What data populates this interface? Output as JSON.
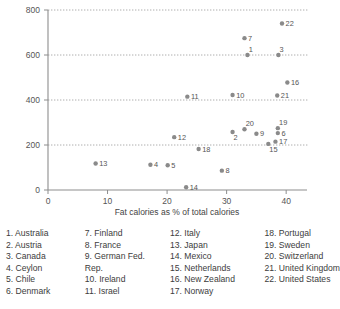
{
  "chart_data": {
    "type": "scatter",
    "title": "",
    "xlabel": "Fat calories as % of total calories",
    "ylabel": "",
    "xlim": [
      0,
      43.5
    ],
    "ylim": [
      0,
      800
    ],
    "xticks": [
      0,
      10,
      20,
      30,
      40
    ],
    "yticks": [
      0,
      200,
      400,
      600,
      800
    ],
    "xtick_labels": [
      "0",
      "10",
      "20",
      "30",
      "40"
    ],
    "ytick_labels": [
      "0",
      "200",
      "400",
      "600",
      "800"
    ],
    "grid": "horizontal-dotted",
    "legend_position": "below-plot",
    "marker_color": "#8a8a8a",
    "points": [
      {
        "id": "1",
        "name": "Australia",
        "x": 33.5,
        "y": 600,
        "label_pos": "above-right"
      },
      {
        "id": "2",
        "name": "Austria",
        "x": 31.0,
        "y": 258,
        "label_pos": "below-right"
      },
      {
        "id": "3",
        "name": "Canada",
        "x": 38.7,
        "y": 600,
        "label_pos": "above-right"
      },
      {
        "id": "4",
        "name": "Ceylon",
        "x": 17.2,
        "y": 112,
        "label_pos": "right"
      },
      {
        "id": "5",
        "name": "Chile",
        "x": 20.1,
        "y": 110,
        "label_pos": "right"
      },
      {
        "id": "6",
        "name": "Denmark",
        "x": 38.6,
        "y": 253,
        "label_pos": "right"
      },
      {
        "id": "7",
        "name": "Finland",
        "x": 33.0,
        "y": 675,
        "label_pos": "right"
      },
      {
        "id": "8",
        "name": "France",
        "x": 29.2,
        "y": 86,
        "label_pos": "right"
      },
      {
        "id": "9",
        "name": "German Fed. Rep.",
        "x": 35.0,
        "y": 250,
        "label_pos": "right"
      },
      {
        "id": "10",
        "name": "Ireland",
        "x": 31.0,
        "y": 422,
        "label_pos": "right"
      },
      {
        "id": "11",
        "name": "Israel",
        "x": 23.4,
        "y": 415,
        "label_pos": "right"
      },
      {
        "id": "12",
        "name": "Italy",
        "x": 21.2,
        "y": 235,
        "label_pos": "right"
      },
      {
        "id": "13",
        "name": "Japan",
        "x": 8.0,
        "y": 118,
        "label_pos": "right"
      },
      {
        "id": "14",
        "name": "Mexico",
        "x": 23.2,
        "y": 12,
        "label_pos": "right"
      },
      {
        "id": "15",
        "name": "Netherlands",
        "x": 37.0,
        "y": 205,
        "label_pos": "below-right"
      },
      {
        "id": "16",
        "name": "New Zealand",
        "x": 40.2,
        "y": 478,
        "label_pos": "right"
      },
      {
        "id": "17",
        "name": "Norway",
        "x": 38.2,
        "y": 215,
        "label_pos": "right"
      },
      {
        "id": "18",
        "name": "Portugal",
        "x": 25.3,
        "y": 182,
        "label_pos": "right"
      },
      {
        "id": "19",
        "name": "Sweden",
        "x": 38.6,
        "y": 275,
        "label_pos": "above-right"
      },
      {
        "id": "20",
        "name": "Switzerland",
        "x": 33.0,
        "y": 270,
        "label_pos": "above-right"
      },
      {
        "id": "21",
        "name": "United Kingdom",
        "x": 38.5,
        "y": 420,
        "label_pos": "right"
      },
      {
        "id": "22",
        "name": "United States",
        "x": 39.3,
        "y": 740,
        "label_pos": "right"
      }
    ]
  },
  "legend": {
    "columns": [
      {
        "entries": [
          "1. Australia",
          "2. Austria",
          "3. Canada",
          "4. Ceylon",
          "5. Chile",
          "6. Denmark"
        ]
      },
      {
        "entries": [
          "7. Finland",
          "8. France",
          "9. German Fed.",
          "Rep.",
          "10. Ireland",
          "11. Israel"
        ]
      },
      {
        "entries": [
          "12. Italy",
          "13. Japan",
          "14. Mexico",
          "15. Netherlands",
          "16. New Zealand",
          "17. Norway"
        ]
      },
      {
        "entries": [
          "18. Portugal",
          "19. Sweden",
          "20. Switzerland",
          "21. United Kingdom",
          "22. United States"
        ]
      }
    ]
  }
}
